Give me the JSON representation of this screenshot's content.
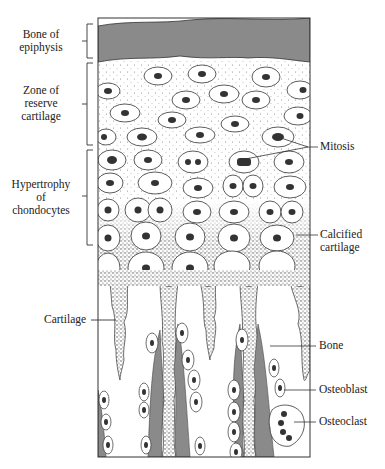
{
  "figure": {
    "colors": {
      "bone": "#8a8a8a",
      "outline": "#2a2a2a",
      "cartilage_matrix": "#ffffff",
      "calcified_stipple": "#555555"
    }
  },
  "labels": {
    "left": [
      {
        "id": "bone-of-epiphysis",
        "text_lines": [
          "Bone of",
          "epiphysis"
        ]
      },
      {
        "id": "zone-of-reserve-cartilage",
        "text_lines": [
          "Zone of",
          "reserve",
          "cartilage"
        ]
      },
      {
        "id": "hypertrophy-of-chondocytes",
        "text_lines": [
          "Hypertrophy",
          "of",
          "chondocytes"
        ]
      },
      {
        "id": "cartilage",
        "text_lines": [
          "Cartilage"
        ]
      }
    ],
    "right": [
      {
        "id": "mitosis",
        "text_lines": [
          "Mitosis"
        ]
      },
      {
        "id": "calcified-cartilage",
        "text_lines": [
          "Calcified",
          "cartilage"
        ]
      },
      {
        "id": "bone",
        "text_lines": [
          "Bone"
        ]
      },
      {
        "id": "osteoblast",
        "text_lines": [
          "Osteoblast"
        ]
      },
      {
        "id": "osteoclast",
        "text_lines": [
          "Osteoclast"
        ]
      }
    ]
  }
}
